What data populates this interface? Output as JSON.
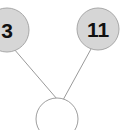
{
  "diagram": {
    "background_color": "#ffffff",
    "edge_color": "#9a9a9a",
    "filled_node_fill": "#d6d6d6",
    "filled_node_stroke": "#a8a8a8",
    "empty_node_fill": "#ffffff",
    "empty_node_stroke": "#9e9e9e",
    "label_color": "#111111",
    "nodes": [
      {
        "id": "node-left",
        "label": "3",
        "cx": 7,
        "cy": 30,
        "r": 22,
        "filled": true,
        "clipped": "left"
      },
      {
        "id": "node-right",
        "label": "11",
        "cx": 98,
        "cy": 29,
        "r": 21,
        "filled": true,
        "clipped": "none"
      },
      {
        "id": "node-bottom",
        "label": "",
        "cx": 57,
        "cy": 119,
        "r": 21,
        "filled": false,
        "clipped": "bottom"
      }
    ],
    "edges": [
      {
        "id": "edge-left-to-bottom",
        "from": "node-left",
        "to": "node-bottom",
        "x1": 14,
        "y1": 49,
        "x2": 57,
        "y2": 99
      },
      {
        "id": "edge-right-to-bottom",
        "from": "node-right",
        "to": "node-bottom",
        "x1": 91,
        "y1": 49,
        "x2": 63,
        "y2": 100
      }
    ]
  }
}
